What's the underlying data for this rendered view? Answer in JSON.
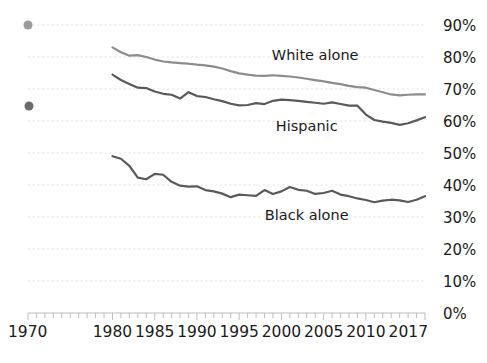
{
  "chart_data": {
    "type": "line",
    "title": "",
    "subtitle": "",
    "xlabel": "",
    "ylabel": "",
    "xlim": [
      1970,
      2017
    ],
    "ylim": [
      0,
      95
    ],
    "grid": true,
    "grid_axis": "y",
    "legend_position": "inline-annotations",
    "y_ticks": [
      0,
      10,
      20,
      30,
      40,
      50,
      60,
      70,
      80,
      90
    ],
    "y_tick_labels": [
      "0%",
      "10%",
      "20%",
      "30%",
      "40%",
      "50%",
      "60%",
      "70%",
      "80%",
      "90%"
    ],
    "x_ticks": [
      1970,
      1980,
      1985,
      1990,
      1995,
      2000,
      2005,
      2010,
      2017
    ],
    "x_tick_labels": [
      "1970",
      "1980",
      "1985",
      "1990",
      "1995",
      "2000",
      "2005",
      "2010",
      "2017"
    ],
    "x_minor_tick_step": 1,
    "series": [
      {
        "name": "White alone",
        "color": "#8c8c8c",
        "label_x": 2004,
        "label_y": 79,
        "x": [
          1980,
          1981,
          1982,
          1983,
          1984,
          1985,
          1986,
          1987,
          1988,
          1989,
          1990,
          1991,
          1992,
          1993,
          1994,
          1995,
          1996,
          1997,
          1998,
          1999,
          2000,
          2001,
          2002,
          2003,
          2004,
          2005,
          2006,
          2007,
          2008,
          2009,
          2010,
          2011,
          2012,
          2013,
          2014,
          2015,
          2016,
          2017
        ],
        "values": [
          83.0,
          81.5,
          80.4,
          80.6,
          80.0,
          79.2,
          78.6,
          78.3,
          78.1,
          77.9,
          77.6,
          77.4,
          77.0,
          76.4,
          75.6,
          74.9,
          74.5,
          74.2,
          74.1,
          74.3,
          74.1,
          73.9,
          73.6,
          73.2,
          72.8,
          72.4,
          71.9,
          71.5,
          71.0,
          70.6,
          70.4,
          69.7,
          69.0,
          68.3,
          68.0,
          68.2,
          68.3,
          68.3
        ],
        "start_value": 83.0,
        "end_value": 68.3
      },
      {
        "name": "Hispanic",
        "color": "#595959",
        "label_x": 2003,
        "label_y": 57,
        "x": [
          1980,
          1981,
          1982,
          1983,
          1984,
          1985,
          1986,
          1987,
          1988,
          1989,
          1990,
          1991,
          1992,
          1993,
          1994,
          1995,
          1996,
          1997,
          1998,
          1999,
          2000,
          2001,
          2002,
          2003,
          2004,
          2005,
          2006,
          2007,
          2008,
          2009,
          2010,
          2011,
          2012,
          2013,
          2014,
          2015,
          2016,
          2017
        ],
        "values": [
          74.5,
          72.8,
          71.6,
          70.4,
          70.3,
          69.2,
          68.5,
          68.2,
          67.0,
          69.0,
          67.8,
          67.5,
          66.8,
          66.2,
          65.4,
          64.9,
          65.0,
          65.6,
          65.3,
          66.3,
          66.7,
          66.5,
          66.3,
          66.0,
          65.7,
          65.4,
          65.8,
          65.3,
          64.8,
          64.8,
          62.0,
          60.3,
          59.8,
          59.4,
          58.8,
          59.3,
          60.2,
          61.2
        ],
        "start_value": 74.5,
        "end_value": 61.2
      },
      {
        "name": "Black alone",
        "color": "#595959",
        "label_x": 2003,
        "label_y": 29,
        "x": [
          1980,
          1981,
          1982,
          1983,
          1984,
          1985,
          1986,
          1987,
          1988,
          1989,
          1990,
          1991,
          1992,
          1993,
          1994,
          1995,
          1996,
          1997,
          1998,
          1999,
          2000,
          2001,
          2002,
          2003,
          2004,
          2005,
          2006,
          2007,
          2008,
          2009,
          2010,
          2011,
          2012,
          2013,
          2014,
          2015,
          2016,
          2017
        ],
        "values": [
          49.0,
          48.2,
          46.0,
          42.3,
          41.8,
          43.5,
          43.2,
          41.0,
          39.8,
          39.5,
          39.6,
          38.4,
          38.0,
          37.3,
          36.2,
          37.0,
          36.8,
          36.6,
          38.4,
          37.2,
          38.0,
          39.4,
          38.5,
          38.2,
          37.2,
          37.5,
          38.2,
          37.0,
          36.5,
          35.8,
          35.3,
          34.6,
          35.1,
          35.4,
          35.2,
          34.7,
          35.4,
          36.5
        ],
        "start_value": 49.0,
        "end_value": 36.5
      }
    ],
    "markers": [
      {
        "name": "upper-dot",
        "x_px": 28,
        "y_px": 25,
        "color": "#9a9a9a",
        "radius": 4.5
      },
      {
        "name": "lower-dot",
        "x_px": 29,
        "y_px": 106,
        "color": "#6b6b6b",
        "radius": 4.5
      }
    ],
    "gridline_color": "#dcdcdc",
    "axis_color": "#bdbdbd"
  }
}
